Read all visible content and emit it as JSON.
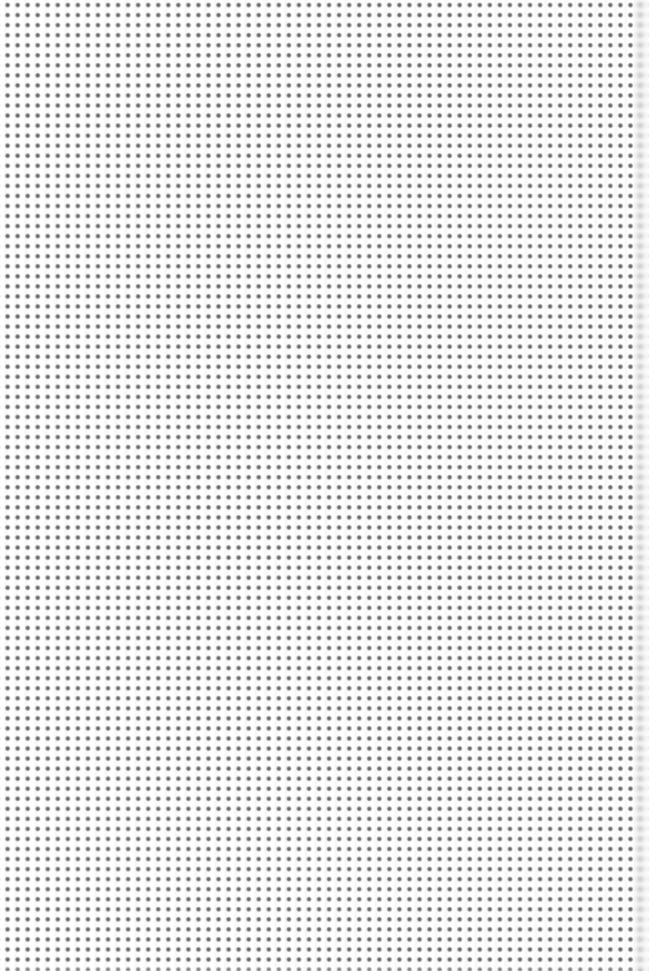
{
  "image": {
    "kind": "seamless-dot-pattern-texture",
    "description": "Repeating grey polka-dot halftone pattern on a near-white background",
    "width_px": 649,
    "height_px": 971,
    "has_text": false,
    "has_ui_controls": false
  },
  "pattern": {
    "type": "dot-grid",
    "arrangement": "square-lattice",
    "pitch_x_px": 10,
    "pitch_y_px": 10,
    "dot_diameter_px": 4,
    "dot_shape": "circle-soft-edge",
    "columns": 65,
    "rows": 98,
    "origin_offset_x_px": 2.5,
    "origin_offset_y_px": 0,
    "top_row_clipped": true
  },
  "colors": {
    "background": "#fdfdfd",
    "page_white": "#ffffff",
    "dot_core": "#6f6f6f",
    "dot_mid": "#8a8a8a",
    "dot_edge": "#cfcfcf",
    "banding_light": "#ffffff",
    "banding_shade": "#f7f7f7",
    "edge_smear": "#a8a8a8"
  },
  "effects": {
    "vertical_banding": {
      "present": true,
      "period_px": 10,
      "direction": "vertical"
    },
    "right_edge_blur": {
      "present": true,
      "width_px": 16,
      "blur_radius_px": 2.2,
      "description": "Soft horizontal smear fading toward the right border"
    },
    "bottom_edge_soften": {
      "present": true,
      "height_px": 10
    }
  }
}
